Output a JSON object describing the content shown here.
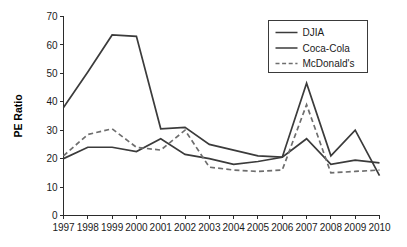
{
  "chart_data": {
    "type": "line",
    "title": "",
    "xlabel": "",
    "ylabel": "PE Ratio",
    "categories": [
      "1997",
      "1998",
      "1999",
      "2000",
      "2001",
      "2002",
      "2003",
      "2004",
      "2005",
      "2006",
      "2007",
      "2008",
      "2009",
      "2010"
    ],
    "xtick_labels": [
      "1997",
      "1998",
      "1999",
      "2000",
      "2001",
      "2002",
      "2003",
      "2004",
      "2005",
      "2006",
      "2007",
      "2008",
      "2009",
      "2010"
    ],
    "ytick_labels": [
      "0",
      "10",
      "20",
      "30",
      "40",
      "50",
      "60",
      "70"
    ],
    "yticks": [
      0,
      10,
      20,
      30,
      40,
      50,
      60,
      70
    ],
    "ylim": [
      0,
      70
    ],
    "grid": false,
    "legend_position": "top-right",
    "series": [
      {
        "name": "DJIA",
        "style": "solid",
        "color": "#3b3b3b",
        "width": 1.7,
        "values": [
          38,
          50.5,
          63.5,
          63,
          30.5,
          31,
          25,
          23,
          21,
          20.5,
          46.5,
          21,
          30,
          14
        ]
      },
      {
        "name": "Coca-Cola",
        "style": "solid",
        "color": "#3b3b3b",
        "width": 1.7,
        "values": [
          20,
          24,
          24,
          22.5,
          27,
          21.5,
          20,
          18,
          19,
          20.5,
          27,
          18,
          19.5,
          18.5
        ]
      },
      {
        "name": "McDonald's",
        "style": "dashed",
        "color": "#6e6e6e",
        "width": 1.7,
        "values": [
          21,
          28.5,
          30.5,
          24,
          23,
          30,
          17,
          16,
          15.5,
          16,
          39,
          15,
          15.5,
          16
        ]
      }
    ]
  },
  "legend": {
    "entries": [
      {
        "label": "DJIA"
      },
      {
        "label": "Coca-Cola"
      },
      {
        "label": "McDonald's"
      }
    ]
  }
}
